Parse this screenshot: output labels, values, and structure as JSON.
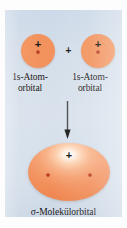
{
  "figure": {
    "caption_language": "de",
    "panel_background": "#d6e0ea",
    "orbital_color": "#f2915b",
    "nucleus_color": "#c0341c",
    "text_color": "#161412"
  },
  "atomic_orbitals": [
    {
      "id": "left",
      "sign_label": "+",
      "label_line1": "1s-Atom-",
      "label_line2": "orbital"
    },
    {
      "id": "right",
      "sign_label": "+",
      "label_line1": "1s-Atom-",
      "label_line2": "orbital"
    }
  ],
  "combine_operator": "+",
  "arrow": {
    "direction": "down",
    "color": "#2b2b2b"
  },
  "molecular_orbital": {
    "sign_label": "+",
    "label": "σ-Molekülorbital",
    "nuclei_count": 2
  }
}
